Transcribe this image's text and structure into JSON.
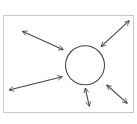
{
  "diagram": {
    "title": "",
    "colors": {
      "background": "#ffffff",
      "frame": "#c8c8c8",
      "stroke": "#454545"
    },
    "frame": {
      "x": 3,
      "y": 15,
      "width": 130,
      "height": 97
    },
    "circle": {
      "cx": 85,
      "cy": 65.3,
      "r": 19.5
    },
    "arrows": [
      {
        "name": "arrow-top-left",
        "x1": 22.3,
        "y1": 31.3,
        "x2": 63.3,
        "y2": 49.7,
        "bidirectional": true
      },
      {
        "name": "arrow-top-right",
        "x1": 129.3,
        "y1": 20.7,
        "x2": 101,
        "y2": 46.7,
        "bidirectional": true
      },
      {
        "name": "arrow-left",
        "x1": 9,
        "y1": 90,
        "x2": 62.3,
        "y2": 76.7,
        "bidirectional": true
      },
      {
        "name": "arrow-bottom",
        "x1": 85.3,
        "y1": 88,
        "x2": 89.3,
        "y2": 106.3,
        "bidirectional": true
      },
      {
        "name": "arrow-bottom-right",
        "x1": 106.7,
        "y1": 85,
        "x2": 127.3,
        "y2": 103.3,
        "bidirectional": true
      }
    ]
  }
}
